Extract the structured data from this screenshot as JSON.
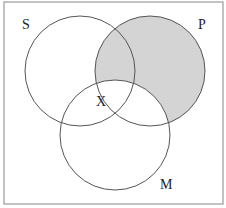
{
  "diagram": {
    "type": "venn",
    "sets": [
      {
        "name": "S",
        "label": "S"
      },
      {
        "name": "P",
        "label": "P"
      },
      {
        "name": "M",
        "label": "M"
      }
    ],
    "shaded_region": "P minus (S ∪ M) excluded? — shaded area is P outside M",
    "marker": {
      "label": "X"
    },
    "colors": {
      "shade": "#d4d4d4",
      "stroke": "#555555",
      "border": "#999999"
    }
  }
}
